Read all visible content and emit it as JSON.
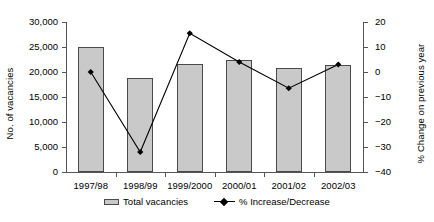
{
  "chart_data": {
    "type": "bar",
    "title": "",
    "categories": [
      "1997/98",
      "1998/99",
      "1999/2000",
      "2000/01",
      "2001/02",
      "2002/03"
    ],
    "xlabel": "",
    "ylabel": "No. of vacancies",
    "y2label": "% Change on previous year",
    "ylim": [
      0,
      30000
    ],
    "y2lim": [
      -40,
      20
    ],
    "grid": false,
    "legend_position": "bottom",
    "y_ticks": [
      "0",
      "5,000",
      "10,000",
      "15,000",
      "20,000",
      "25,000",
      "30,000"
    ],
    "y_tick_values": [
      0,
      5000,
      10000,
      15000,
      20000,
      25000,
      30000
    ],
    "y2_ticks": [
      "-40",
      "-30",
      "-20",
      "-10",
      "0",
      "10",
      "20"
    ],
    "y2_tick_values": [
      -40,
      -30,
      -20,
      -10,
      0,
      10,
      20
    ],
    "series": [
      {
        "name": "Total vacancies",
        "kind": "bar",
        "axis": "left",
        "color": "#c9c9c9",
        "edge_color": "#4a4a4a",
        "values": [
          25000,
          18800,
          21600,
          22400,
          20900,
          21500
        ]
      },
      {
        "name": "% Increase/Decrease",
        "kind": "line",
        "axis": "right",
        "color": "#000000",
        "marker": "diamond",
        "values": [
          0,
          -32,
          15.5,
          4,
          -6.5,
          3
        ]
      }
    ],
    "legend": [
      "Total vacancies",
      "% Increase/Decrease"
    ]
  },
  "axes": {
    "left_title": "No. of vacancies",
    "right_title": "% Change on previous year"
  },
  "legend": {
    "bar_label": "Total vacancies",
    "line_label": "% Increase/Decrease"
  }
}
